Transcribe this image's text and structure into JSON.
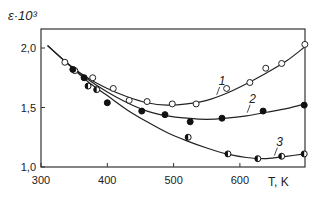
{
  "chart_data": {
    "type": "line",
    "title": "",
    "ylabel": "ε·10³",
    "xlabel": "T, K",
    "xlim": [
      300,
      700
    ],
    "ylim": [
      1.0,
      2.1
    ],
    "x_ticks": [
      {
        "value": 300,
        "label": "300"
      },
      {
        "value": 400,
        "label": "400"
      },
      {
        "value": 500,
        "label": "500"
      },
      {
        "value": 600,
        "label": "600"
      }
    ],
    "y_ticks": [
      {
        "value": 1.0,
        "label": "1,0"
      },
      {
        "value": 1.5,
        "label": "1,5"
      },
      {
        "value": 2.0,
        "label": "2,0"
      }
    ],
    "grid": false,
    "legend": "inline curve labels",
    "series": [
      {
        "name": "1",
        "marker": "open-circle",
        "points": [
          [
            336,
            1.88
          ],
          [
            351,
            1.81
          ],
          [
            378,
            1.75
          ],
          [
            409,
            1.66
          ],
          [
            433,
            1.56
          ],
          [
            460,
            1.55
          ],
          [
            498,
            1.53
          ],
          [
            534,
            1.53
          ],
          [
            580,
            1.66
          ],
          [
            615,
            1.71
          ],
          [
            639,
            1.83
          ],
          [
            663,
            1.87
          ],
          [
            698,
            2.03
          ]
        ],
        "curve": [
          [
            310,
            2.02
          ],
          [
            340,
            1.87
          ],
          [
            370,
            1.75
          ],
          [
            400,
            1.66
          ],
          [
            430,
            1.59
          ],
          [
            460,
            1.54
          ],
          [
            490,
            1.52
          ],
          [
            520,
            1.53
          ],
          [
            550,
            1.56
          ],
          [
            580,
            1.62
          ],
          [
            610,
            1.7
          ],
          [
            640,
            1.79
          ],
          [
            670,
            1.89
          ],
          [
            698,
            2.01
          ]
        ],
        "label_pos": [
          568,
          1.69
        ]
      },
      {
        "name": "2",
        "marker": "filled-circle",
        "points": [
          [
            348,
            1.82
          ],
          [
            365,
            1.75
          ],
          [
            400,
            1.54
          ],
          [
            452,
            1.47
          ],
          [
            487,
            1.44
          ],
          [
            525,
            1.38
          ],
          [
            573,
            1.41
          ],
          [
            635,
            1.47
          ],
          [
            697,
            1.52
          ]
        ],
        "curve": [
          [
            310,
            2.02
          ],
          [
            340,
            1.87
          ],
          [
            370,
            1.74
          ],
          [
            400,
            1.63
          ],
          [
            430,
            1.54
          ],
          [
            460,
            1.47
          ],
          [
            490,
            1.43
          ],
          [
            520,
            1.41
          ],
          [
            550,
            1.4
          ],
          [
            580,
            1.41
          ],
          [
            610,
            1.43
          ],
          [
            640,
            1.46
          ],
          [
            670,
            1.49
          ],
          [
            698,
            1.53
          ]
        ],
        "label_pos": [
          614,
          1.54
        ]
      },
      {
        "name": "3",
        "marker": "half-filled-circle",
        "points": [
          [
            371,
            1.68
          ],
          [
            384,
            1.65
          ],
          [
            522,
            1.25
          ],
          [
            582,
            1.11
          ],
          [
            627,
            1.07
          ],
          [
            663,
            1.09
          ],
          [
            697,
            1.11
          ]
        ],
        "curve": [
          [
            310,
            2.02
          ],
          [
            340,
            1.87
          ],
          [
            370,
            1.72
          ],
          [
            400,
            1.6
          ],
          [
            430,
            1.48
          ],
          [
            460,
            1.38
          ],
          [
            490,
            1.29
          ],
          [
            520,
            1.22
          ],
          [
            550,
            1.16
          ],
          [
            580,
            1.11
          ],
          [
            610,
            1.08
          ],
          [
            640,
            1.07
          ],
          [
            670,
            1.09
          ],
          [
            698,
            1.11
          ]
        ],
        "label_pos": [
          655,
          1.18
        ]
      }
    ]
  },
  "axes": {
    "ylabel": "ε·10³",
    "xlabel": "T, K"
  }
}
